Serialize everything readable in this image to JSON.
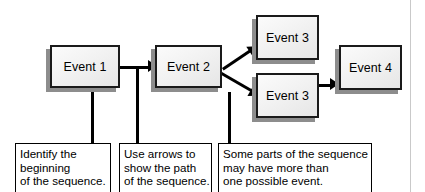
{
  "diagram": {
    "colors": {
      "box_border": "#1a1a1a",
      "box_fill": "#f2f2f2",
      "box_shadow": "#8d8d8d",
      "connector": "#000000",
      "caption_border": "#000000",
      "page_rule": "#c9c9c9",
      "background": "#ffffff"
    },
    "events": [
      {
        "id": "event-1",
        "label": "Event 1"
      },
      {
        "id": "event-2",
        "label": "Event 2"
      },
      {
        "id": "event-3-top",
        "label": "Event 3"
      },
      {
        "id": "event-3-bottom",
        "label": "Event 3"
      },
      {
        "id": "event-4",
        "label": "Event 4"
      }
    ],
    "captions": [
      {
        "id": "caption-identify",
        "lines": [
          "Identify the",
          "beginning",
          "of the sequence."
        ]
      },
      {
        "id": "caption-arrows",
        "lines": [
          "Use arrows to",
          "show the path",
          "of the sequence."
        ]
      },
      {
        "id": "caption-branching",
        "lines": [
          "Some parts of the sequence",
          "may have more than",
          "one possible event."
        ]
      }
    ],
    "connectors": [
      {
        "id": "event1-to-event2",
        "type": "arrow-right"
      },
      {
        "id": "event2-to-event3-top",
        "type": "arrow-diagonal-up"
      },
      {
        "id": "event2-to-event3-bottom",
        "type": "arrow-diagonal-down"
      },
      {
        "id": "event3-bottom-to-event4",
        "type": "arrow-right"
      },
      {
        "id": "leader-event1-to-caption1",
        "type": "leader-line"
      },
      {
        "id": "leader-arrow-to-caption2",
        "type": "leader-line"
      },
      {
        "id": "leader-branch-to-caption3",
        "type": "leader-line"
      }
    ]
  }
}
